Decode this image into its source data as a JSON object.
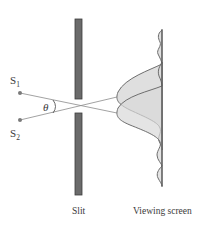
{
  "diagram": {
    "sources": [
      {
        "label": "S",
        "subscript": "1",
        "x": 20,
        "y": 93
      },
      {
        "label": "S",
        "subscript": "2",
        "x": 20,
        "y": 120
      }
    ],
    "angle_label": "θ",
    "labels": {
      "slit": "Slit",
      "screen": "Viewing screen"
    },
    "colors": {
      "barrier": "#6b6b6b",
      "barrier_edge": "#3d3d3d",
      "ray": "#8a8a8a",
      "curve": "#6e6e6e",
      "curve_fill": "#d9d9d9",
      "screen": "#555555",
      "source_dot": "#7a7a7a",
      "text": "#3a3a3a"
    }
  }
}
